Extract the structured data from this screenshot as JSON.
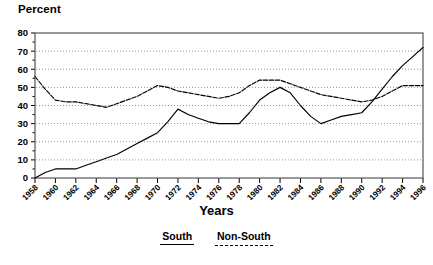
{
  "chart_data": {
    "type": "line",
    "title": "",
    "ylabel": "Percent",
    "xlabel": "Years",
    "ylim": [
      0,
      80
    ],
    "ytick_values": [
      0,
      10,
      20,
      30,
      40,
      50,
      60,
      70,
      80
    ],
    "ytick_labels": [
      "0",
      "10",
      "20",
      "30",
      "40",
      "50",
      "60",
      "70",
      "80"
    ],
    "grid": true,
    "legend_position": "bottom-center",
    "categories": [
      "1958",
      "1959",
      "1960",
      "1961",
      "1962",
      "1963",
      "1964",
      "1965",
      "1966",
      "1967",
      "1968",
      "1969",
      "1970",
      "1971",
      "1972",
      "1973",
      "1974",
      "1975",
      "1976",
      "1977",
      "1978",
      "1979",
      "1980",
      "1981",
      "1982",
      "1983",
      "1984",
      "1985",
      "1986",
      "1987",
      "1988",
      "1989",
      "1990",
      "1991",
      "1992",
      "1993",
      "1994",
      "1995",
      "1996"
    ],
    "xtick_labels": [
      "1958",
      "1960",
      "1962",
      "1964",
      "1966",
      "1968",
      "1970",
      "1972",
      "1974",
      "1976",
      "1978",
      "1980",
      "1982",
      "1984",
      "1986",
      "1988",
      "1990",
      "1992",
      "1994",
      "1996"
    ],
    "series": [
      {
        "name": "South",
        "style": "solid",
        "color": "#000000",
        "values": [
          0,
          3,
          5,
          5,
          5,
          7,
          9,
          11,
          13,
          16,
          19,
          22,
          25,
          31,
          38,
          35,
          33,
          31,
          30,
          30,
          30,
          36,
          43,
          47,
          50,
          47,
          40,
          34,
          30,
          32,
          34,
          35,
          36,
          42,
          49,
          56,
          62,
          67,
          72
        ]
      },
      {
        "name": "Non-South",
        "style": "dashed",
        "color": "#000000",
        "values": [
          56,
          49,
          43,
          42,
          42,
          41,
          40,
          39,
          41,
          43,
          45,
          48,
          51,
          50,
          48,
          47,
          46,
          45,
          44,
          45,
          47,
          51,
          54,
          54,
          54,
          52,
          50,
          48,
          46,
          45,
          44,
          43,
          42,
          43,
          45,
          48,
          51,
          51,
          51
        ]
      }
    ],
    "legend": [
      {
        "label": "South",
        "style": "solid"
      },
      {
        "label": "Non-South",
        "style": "dashed"
      }
    ]
  }
}
